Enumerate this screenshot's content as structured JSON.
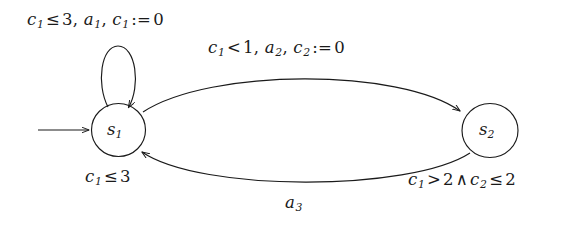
{
  "figure": {
    "type": "timed-automaton-state-diagram",
    "background_color": "#ffffff",
    "stroke_color": "#1a1a1a",
    "width": 587,
    "height": 227
  },
  "states": [
    {
      "id": "s1",
      "name": "s",
      "index": "1",
      "initial": true,
      "invariant": {
        "lhs": "c",
        "lhs_index": "1",
        "operator": "≤",
        "rhs": "3"
      },
      "invariant_text": "c1 ≤ 3"
    },
    {
      "id": "s2",
      "name": "s",
      "index": "2",
      "initial": false
    }
  ],
  "transitions": [
    {
      "id": "self-loop",
      "from": "s1",
      "to": "s1",
      "guard": {
        "lhs": "c",
        "lhs_index": "1",
        "operator": "≤",
        "rhs": "3"
      },
      "action": {
        "name": "a",
        "index": "1"
      },
      "reset": {
        "clock": "c",
        "clock_index": "1",
        "operator": ":=",
        "value": "0"
      },
      "label_text": "c1 ≤ 3, a1, c1 := 0"
    },
    {
      "id": "s1-to-s2",
      "from": "s1",
      "to": "s2",
      "guard": {
        "lhs": "c",
        "lhs_index": "1",
        "operator": "<",
        "rhs": "1"
      },
      "action": {
        "name": "a",
        "index": "2"
      },
      "reset": {
        "clock": "c",
        "clock_index": "2",
        "operator": ":=",
        "value": "0"
      },
      "label_text": "c1 < 1, a2, c2 := 0"
    },
    {
      "id": "s2-to-s1",
      "from": "s2",
      "to": "s1",
      "guard": {
        "left": {
          "lhs": "c",
          "lhs_index": "1",
          "operator": ">",
          "rhs": "2"
        },
        "connective": "∧",
        "right": {
          "lhs": "c",
          "lhs_index": "2",
          "operator": "≤",
          "rhs": "2"
        }
      },
      "guard_text": "c1 > 2 ∧ c2 ≤ 2",
      "action": {
        "name": "a",
        "index": "3"
      },
      "action_text": "a3"
    }
  ],
  "labels": {
    "loop": {
      "clock": "c",
      "clock_sub": "1",
      "op": "≤",
      "bound": "3",
      "sep1": ", ",
      "action": "a",
      "action_sub": "1",
      "sep2": ", ",
      "reset_clock": "c",
      "reset_clock_sub": "1",
      "assign": ":=",
      "reset_value": "0"
    },
    "top": {
      "clock": "c",
      "clock_sub": "1",
      "op": "<",
      "bound": "1",
      "sep1": ", ",
      "action": "a",
      "action_sub": "2",
      "sep2": ", ",
      "reset_clock": "c",
      "reset_clock_sub": "2",
      "assign": ":=",
      "reset_value": "0"
    },
    "invariant_s1": {
      "clock": "c",
      "clock_sub": "1",
      "op": "≤",
      "bound": "3"
    },
    "guard_s2_s1": {
      "clock_a": "c",
      "clock_a_sub": "1",
      "op_a": ">",
      "bound_a": "2",
      "connective": "∧",
      "clock_b": "c",
      "clock_b_sub": "2",
      "op_b": "≤",
      "bound_b": "2"
    },
    "bottom_action": {
      "action": "a",
      "action_sub": "3"
    },
    "state_s1": {
      "name": "s",
      "sub": "1"
    },
    "state_s2": {
      "name": "s",
      "sub": "2"
    }
  }
}
